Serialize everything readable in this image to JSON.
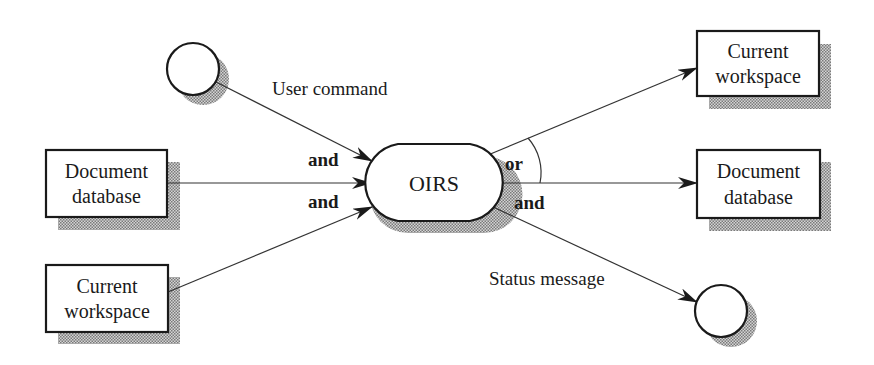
{
  "diagram": {
    "colors": {
      "stroke": "#1a1a1a",
      "shadow": "#9a9a9a",
      "background": "#ffffff"
    },
    "process": {
      "label": "OIRS"
    },
    "inputs": {
      "user_terminal": {
        "shape": "circle",
        "label": ""
      },
      "document_database": {
        "line1": "Document",
        "line2": "database"
      },
      "current_workspace": {
        "line1": "Current",
        "line2": "workspace"
      }
    },
    "outputs": {
      "current_workspace": {
        "line1": "Current",
        "line2": "workspace"
      },
      "document_database": {
        "line1": "Document",
        "line2": "database"
      },
      "user_terminal": {
        "shape": "circle",
        "label": ""
      }
    },
    "flows": {
      "user_command": "User command",
      "status_message": "Status message"
    },
    "operators": {
      "input_and_1": "and",
      "input_and_2": "and",
      "output_or": "or",
      "output_and": "and"
    }
  }
}
